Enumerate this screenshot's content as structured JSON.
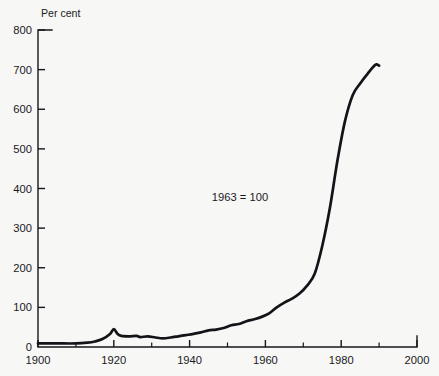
{
  "chart_data": {
    "type": "line",
    "title": "",
    "subtitle": "",
    "unit_label": "Per cent",
    "annotation": "1963 = 100",
    "xlabel": "",
    "ylabel": "Per cent",
    "grid": false,
    "legend": null,
    "xlim": [
      1900,
      2000
    ],
    "ylim": [
      0,
      800
    ],
    "x_ticks_major": [
      1900,
      1920,
      1940,
      1960,
      1980,
      2000
    ],
    "x_ticks_minor": [
      1910,
      1930,
      1950,
      1970,
      1990
    ],
    "x_tick_labels": [
      "1900",
      "1920",
      "1940",
      "1960",
      "1980",
      "2000"
    ],
    "y_ticks": [
      0,
      100,
      200,
      300,
      400,
      500,
      600,
      700,
      800
    ],
    "y_tick_labels": [
      "0",
      "100",
      "200",
      "300",
      "400",
      "500",
      "600",
      "700",
      "800"
    ],
    "series": [
      {
        "name": "Index",
        "color": "#141317",
        "x": [
          1900,
          1905,
          1910,
          1913,
          1915,
          1917,
          1919,
          1920,
          1921,
          1922,
          1924,
          1926,
          1927,
          1929,
          1931,
          1933,
          1935,
          1937,
          1939,
          1941,
          1943,
          1945,
          1947,
          1949,
          1951,
          1953,
          1955,
          1957,
          1959,
          1961,
          1963,
          1965,
          1967,
          1969,
          1971,
          1973,
          1975,
          1977,
          1979,
          1981,
          1983,
          1985,
          1987,
          1989,
          1990
        ],
        "values": [
          9,
          9,
          9,
          11,
          14,
          20,
          33,
          45,
          33,
          28,
          27,
          28,
          25,
          27,
          24,
          22,
          24,
          27,
          30,
          33,
          37,
          42,
          44,
          48,
          55,
          58,
          65,
          70,
          76,
          85,
          100,
          112,
          122,
          135,
          155,
          185,
          255,
          350,
          470,
          570,
          635,
          665,
          690,
          712,
          710
        ]
      }
    ]
  },
  "geometry": {
    "plot_left": 38,
    "plot_right": 417,
    "plot_top": 30,
    "plot_bottom": 347
  }
}
